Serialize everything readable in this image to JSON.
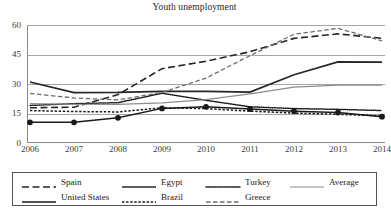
{
  "chart_data": {
    "type": "line",
    "title": "Youth unemployment",
    "xlabel": "",
    "ylabel": "",
    "x": [
      2006,
      2007,
      2008,
      2009,
      2010,
      2011,
      2012,
      2013,
      2014
    ],
    "categories": [
      "2006",
      "2007",
      "2008",
      "2009",
      "2010",
      "2011",
      "2012",
      "2013",
      "2014"
    ],
    "yticks": [
      0,
      15,
      30,
      45,
      60
    ],
    "ylim": [
      0,
      60
    ],
    "grid": true,
    "legend_position": "bottom",
    "series": [
      {
        "name": "Spain",
        "style": "long-dash",
        "color": "#262626",
        "values": [
          17.9,
          18.2,
          24.6,
          37.8,
          41.6,
          46.4,
          53.2,
          55.5,
          53.2
        ]
      },
      {
        "name": "United States",
        "style": "solid-markers",
        "color": "#1a1a1a",
        "values": [
          10.5,
          10.5,
          12.8,
          17.6,
          18.4,
          17.3,
          16.2,
          15.5,
          13.4
        ]
      },
      {
        "name": "Egypt",
        "style": "solid-bold",
        "color": "#262626",
        "values": [
          31.0,
          25.6,
          25.7,
          26.3,
          26.3,
          25.9,
          34.7,
          41.2,
          41.1
        ]
      },
      {
        "name": "Brazil",
        "style": "short-dash",
        "color": "#1a1a1a",
        "values": [
          16.5,
          16.0,
          15.8,
          17.9,
          17.5,
          16.2,
          15.2,
          14.6,
          13.8
        ]
      },
      {
        "name": "Turkey",
        "style": "fine-dot",
        "color": "#1a1a1a",
        "values": [
          19.1,
          20.0,
          20.5,
          25.3,
          21.7,
          18.4,
          17.5,
          17.1,
          16.5
        ]
      },
      {
        "name": "Greece",
        "style": "medium-dash",
        "color": "#6e6e6e",
        "values": [
          25.2,
          22.9,
          21.9,
          25.7,
          33.0,
          44.4,
          55.3,
          58.3,
          51.9
        ]
      },
      {
        "name": "Average",
        "style": "thin-solid",
        "color": "#8c8c8c",
        "values": [
          20.0,
          19.7,
          19.6,
          20.4,
          22.1,
          25.0,
          28.4,
          29.4,
          29.4
        ]
      }
    ]
  },
  "title": "Youth unemployment",
  "axis": {
    "y_tick_labels": [
      "60",
      "45",
      "30",
      "15",
      "0"
    ],
    "x_tick_labels": [
      "2006",
      "2007",
      "2008",
      "2009",
      "2010",
      "2011",
      "2012",
      "2013",
      "2014"
    ]
  },
  "legend": {
    "items": [
      {
        "label": "Spain",
        "style": "long-dash",
        "color": "#262626"
      },
      {
        "label": "Egypt",
        "style": "solid-bold",
        "color": "#262626"
      },
      {
        "label": "Turkey",
        "style": "fine-dot",
        "color": "#1a1a1a"
      },
      {
        "label": "Average",
        "style": "thin-solid",
        "color": "#8c8c8c"
      },
      {
        "label": "United States",
        "style": "solid-markers",
        "color": "#1a1a1a"
      },
      {
        "label": "Brazil",
        "style": "short-dash",
        "color": "#1a1a1a"
      },
      {
        "label": "Greece",
        "style": "medium-dash",
        "color": "#6e6e6e"
      }
    ]
  }
}
